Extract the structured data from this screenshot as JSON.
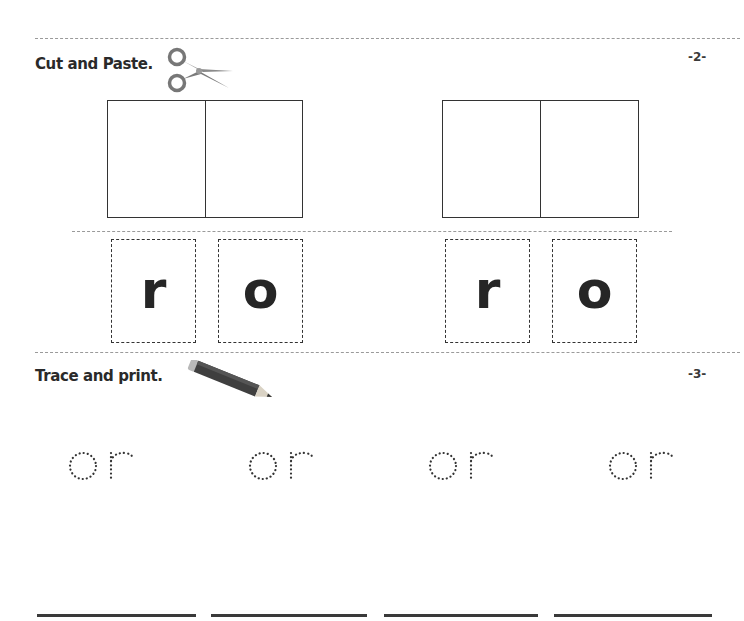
{
  "sections": [
    {
      "number": "-2-",
      "title": "Cut and Paste.",
      "icon": "scissors-icon",
      "paste_boxes": [
        {
          "cells": [
            "",
            ""
          ]
        },
        {
          "cells": [
            "",
            ""
          ]
        }
      ],
      "cut_cards": [
        {
          "letter": "r"
        },
        {
          "letter": "o"
        },
        {
          "letter": "r"
        },
        {
          "letter": "o"
        }
      ]
    },
    {
      "number": "-3-",
      "title": "Trace and print.",
      "icon": "pencil-icon",
      "trace_words": [
        "or",
        "or",
        "or",
        "or"
      ],
      "writing_lines": 4
    }
  ],
  "colors": {
    "ink": "#2b2b2b",
    "dash": "#9a9a9a",
    "scissors": "#7a7a7a",
    "pencil_body": "#3d3d3d"
  }
}
